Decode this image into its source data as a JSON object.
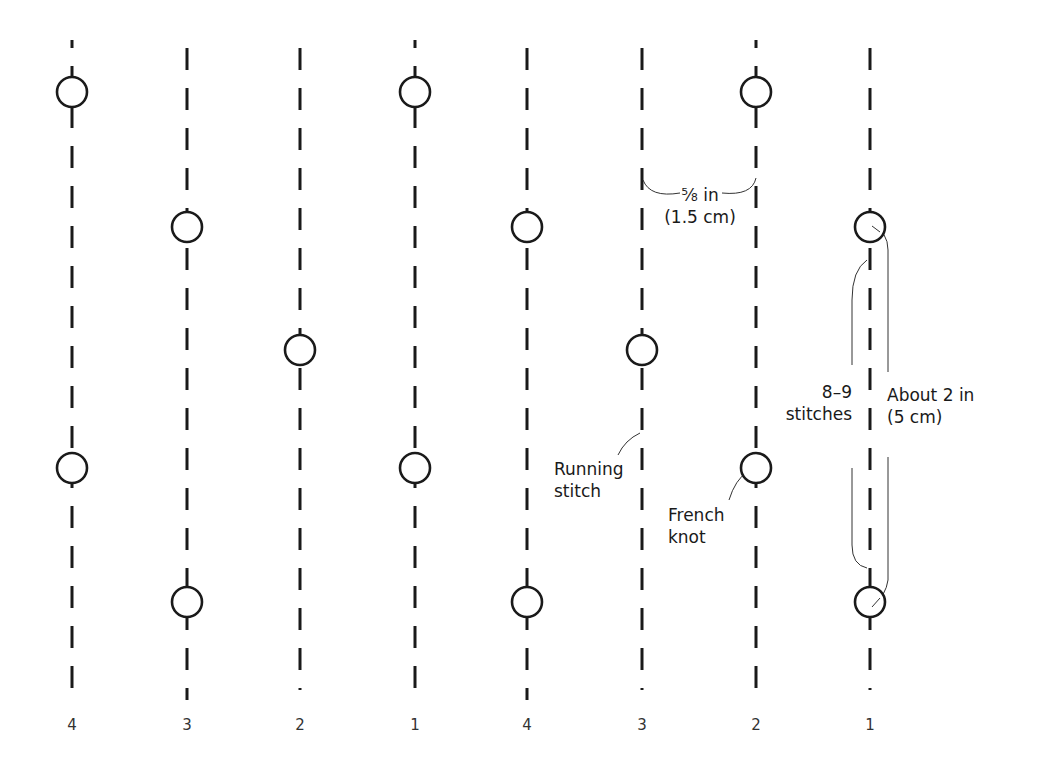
{
  "diagram": {
    "columns": [
      {
        "number": "4",
        "x": 72
      },
      {
        "number": "3",
        "x": 187
      },
      {
        "number": "2",
        "x": 300
      },
      {
        "number": "1",
        "x": 415
      },
      {
        "number": "4",
        "x": 527
      },
      {
        "number": "3",
        "x": 642
      },
      {
        "number": "2",
        "x": 756
      },
      {
        "number": "1",
        "x": 870
      }
    ],
    "french_knots": [
      {
        "column": 1,
        "x": 72,
        "y": 92
      },
      {
        "column": 4,
        "x": 415,
        "y": 92
      },
      {
        "column": 7,
        "x": 756,
        "y": 92
      },
      {
        "column": 2,
        "x": 187,
        "y": 227
      },
      {
        "column": 5,
        "x": 527,
        "y": 227
      },
      {
        "column": 8,
        "x": 870,
        "y": 227
      },
      {
        "column": 3,
        "x": 300,
        "y": 350
      },
      {
        "column": 6,
        "x": 642,
        "y": 350
      },
      {
        "column": 1,
        "x": 72,
        "y": 468
      },
      {
        "column": 4,
        "x": 415,
        "y": 468
      },
      {
        "column": 7,
        "x": 756,
        "y": 468
      },
      {
        "column": 2,
        "x": 187,
        "y": 602
      },
      {
        "column": 5,
        "x": 527,
        "y": 602
      },
      {
        "column": 8,
        "x": 870,
        "y": 602
      }
    ],
    "annotations": {
      "spacing_line1": "⅝ in",
      "spacing_line2": "(1.5 cm)",
      "stitch_count_line1": "8–9",
      "stitch_count_line2": "stitches",
      "length_line1": "About 2 in",
      "length_line2": "(5 cm)",
      "running_stitch_line1": "Running",
      "running_stitch_line2": "stitch",
      "french_knot_line1": "French",
      "french_knot_line2": "knot"
    },
    "column_numbers": [
      "4",
      "3",
      "2",
      "1",
      "4",
      "3",
      "2",
      "1"
    ]
  }
}
